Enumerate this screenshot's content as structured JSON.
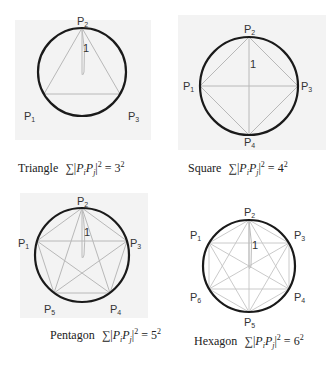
{
  "colors": {
    "circle": "#1a1a1a",
    "chord": "#b8b8b8",
    "background_box": "#f3f3f3",
    "label": "#333333",
    "caption": "#222222"
  },
  "panels": [
    {
      "id": "triangle",
      "caption_name": "Triangle",
      "n": 3,
      "result": "3",
      "exponent": "2",
      "vertex_labels": [
        "P1",
        "P2",
        "P3"
      ],
      "radius_label": "1"
    },
    {
      "id": "square",
      "caption_name": "Square",
      "n": 4,
      "result": "4",
      "exponent": "2",
      "vertex_labels": [
        "P1",
        "P2",
        "P3",
        "P4"
      ],
      "radius_label": "1"
    },
    {
      "id": "pentagon",
      "caption_name": "Pentagon",
      "n": 5,
      "result": "5",
      "exponent": "2",
      "vertex_labels": [
        "P1",
        "P2",
        "P3",
        "P4",
        "P5"
      ],
      "radius_label": "1"
    },
    {
      "id": "hexagon",
      "caption_name": "Hexagon",
      "n": 6,
      "result": "6",
      "exponent": "2",
      "vertex_labels": [
        "P1",
        "P2",
        "P3",
        "P4",
        "P5",
        "P6"
      ],
      "radius_label": "1"
    }
  ],
  "formula": {
    "sum_symbol": "∑",
    "lhs_P": "P",
    "sub_i": "i",
    "sub_j": "j",
    "equals": "="
  }
}
